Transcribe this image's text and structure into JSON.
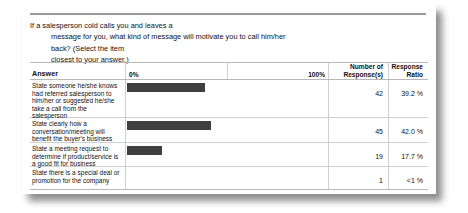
{
  "question": {
    "lines": [
      "If a salesperson cold calls you and leaves a",
      "message for you, what kind of message will motivate you to call him/her",
      "back? (Select the item",
      "closest to your answer.)"
    ]
  },
  "table": {
    "headers": {
      "answer": "Answer",
      "scale_min": "0%",
      "scale_max": "100%",
      "responses_line1": "Number of",
      "responses_line2": "Response(s)",
      "ratio_line1": "Response",
      "ratio_line2": "Ratio"
    }
  },
  "chart_data": {
    "type": "bar",
    "title": "If a salesperson cold calls you and leaves a message for you, what kind of message will motivate you to call him/her back? (Select the item closest to your answer.)",
    "orientation": "horizontal",
    "xlabel": "",
    "ylabel": "",
    "xlim": [
      0,
      100
    ],
    "xtick_labels": [
      "0%",
      "100%"
    ],
    "grid": true,
    "legend": "none",
    "bar_color": "#3f3f3f",
    "categories": [
      "State someone he/she knows had referred salesperson to him/her or suggested he/she take a call from the salesperson",
      "State clearly how a conversation/meeting will benefit the buyer's business",
      "State a meeting request to determine if product/service is a good fit for business",
      "State there is a special deal or promotion for the company"
    ],
    "values": [
      39.2,
      42.0,
      17.7,
      0.9
    ],
    "counts": [
      42,
      45,
      19,
      1
    ],
    "ratio_labels": [
      "39.2 %",
      "42.0 %",
      "17.7 %",
      "<1 %"
    ],
    "count_labels": [
      "42",
      "45",
      "19",
      "1"
    ]
  }
}
